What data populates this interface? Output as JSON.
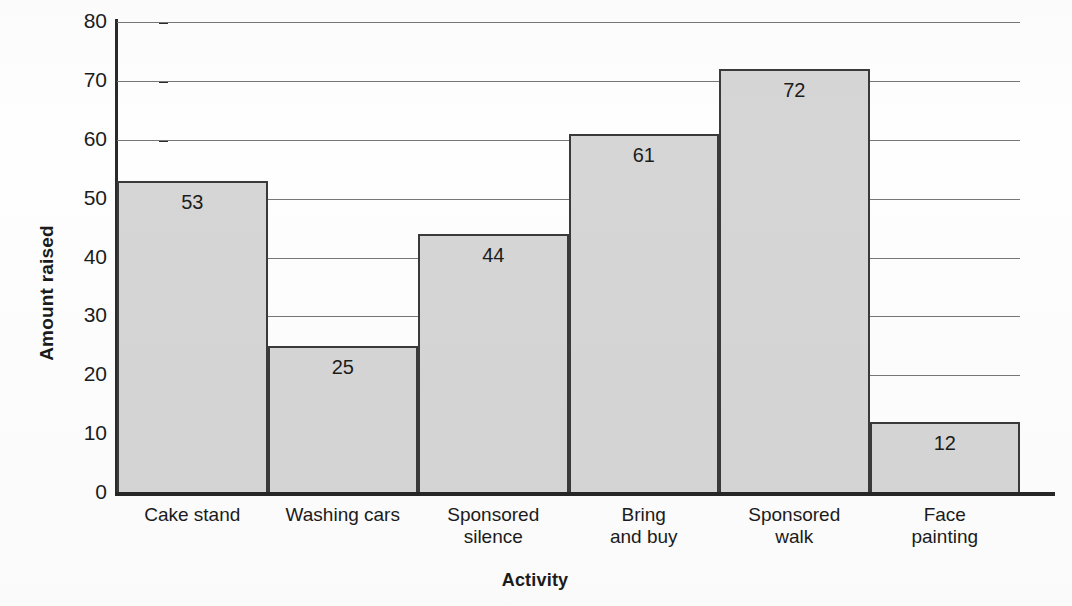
{
  "chart_data": {
    "type": "bar",
    "title": "",
    "categories": [
      "Cake stand",
      "Washing cars",
      "Sponsored silence",
      "Bring and buy",
      "Sponsored walk",
      "Face painting"
    ],
    "category_lines": [
      [
        "Cake stand"
      ],
      [
        "Washing cars"
      ],
      [
        "Sponsored",
        "silence"
      ],
      [
        "Bring",
        "and buy"
      ],
      [
        "Sponsored",
        "walk"
      ],
      [
        "Face",
        "painting"
      ]
    ],
    "values": [
      53,
      25,
      44,
      61,
      72,
      12
    ],
    "value_labels": [
      "53",
      "25",
      "44",
      "61",
      "72",
      "12"
    ],
    "xlabel": "Activity",
    "ylabel": "Amount raised",
    "ylim": [
      0,
      80
    ],
    "ytick_values": [
      0,
      10,
      20,
      30,
      40,
      50,
      60,
      70,
      80
    ],
    "ytick_labels": [
      "0",
      "10",
      "20",
      "30",
      "40",
      "50",
      "60",
      "70",
      "80"
    ],
    "grid": "horizontal",
    "legend": "none",
    "bar_fill_color": "#d6d6d6",
    "bar_edge_color": "#3a3a3a",
    "gridline_color": "#777777",
    "axis_color": "#2a2a2a",
    "text_color": "#1c1c1c"
  }
}
